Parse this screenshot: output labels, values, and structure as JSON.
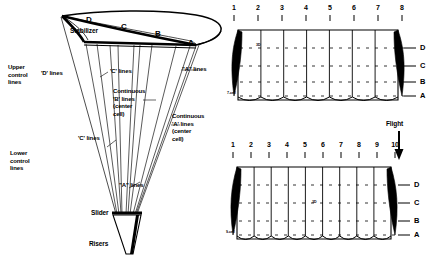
{
  "figure": {
    "background_color": "#ffffff",
    "ink_color": "#000000",
    "width": 441,
    "height": 265
  },
  "canopy_view": {
    "name": "perspective-canopy-with-lines",
    "rib_labels": {
      "d": "D",
      "c": "C",
      "b": "B",
      "a": "A"
    },
    "stabilizer_label": "Stabilizer",
    "line_labels": {
      "upper_control": "Upper\ncontrol\nlines",
      "lower_control": "Lower\ncontrol\nlines",
      "d_lines": "'D' lines",
      "c_lines_upper": "'C' lines",
      "c_lines_lower": "'C' lines",
      "a_lines_upper": "\"A\" lines",
      "a_lines_lower": "\"A\" lines",
      "continuous_b": "Continuous\n'B' lines\n(center\ncell)",
      "continuous_a": "Continuous\n'A' lines\n(center\ncell)"
    },
    "hardware": {
      "slider": "Slider",
      "risers": "Risers"
    }
  },
  "flight": {
    "label": "Flight",
    "arrow": "down-arrow-icon"
  },
  "planforms": [
    {
      "id": "seven-cell",
      "cell_label": "7-cell",
      "cell_count": 7,
      "rib_numbers": [
        "1",
        "2",
        "3",
        "4",
        "5",
        "6",
        "7",
        "8"
      ],
      "row_labels": [
        "D",
        "C",
        "B",
        "A"
      ],
      "center_marker": "3D"
    },
    {
      "id": "nine-cell",
      "cell_label": "9-cell",
      "cell_count": 9,
      "rib_numbers": [
        "1",
        "2",
        "3",
        "4",
        "5",
        "6",
        "7",
        "8",
        "9",
        "10"
      ],
      "row_labels": [
        "D",
        "C",
        "B",
        "A"
      ],
      "center_marker": "3D"
    }
  ]
}
